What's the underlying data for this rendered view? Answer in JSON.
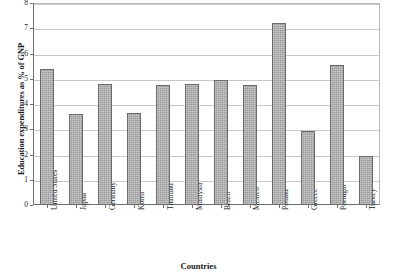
{
  "chart_data": {
    "type": "bar",
    "title": "",
    "xlabel": "Countries",
    "ylabel": "Education expenditures as % of GNP",
    "categories": [
      "United States",
      "Japan",
      "Germany",
      "Korea",
      "Thailand",
      "Malaysia",
      "Brazil",
      "Mexico",
      "Poland",
      "Greece",
      "Portugal",
      "Turkey"
    ],
    "values": [
      5.4,
      3.6,
      4.8,
      3.65,
      4.75,
      4.8,
      4.95,
      4.75,
      7.2,
      2.95,
      5.55,
      1.95
    ],
    "ylim": [
      0,
      8
    ],
    "yticks": [
      0,
      1,
      2,
      3,
      4,
      5,
      6,
      7,
      8
    ],
    "ytick_labels": [
      "0",
      "1",
      "2",
      "3",
      "4",
      "5",
      "6",
      "7",
      "8"
    ],
    "grid": true,
    "legend": false,
    "bar_color": "#9a9a9a",
    "bar_border_color": "#6b6b6b",
    "gridline_color": "#c9c9c9",
    "axis_color": "#6e6e6e"
  }
}
